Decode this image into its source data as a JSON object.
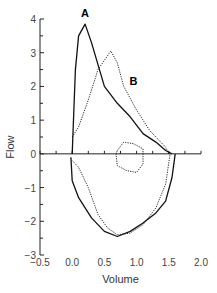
{
  "chart_data": {
    "type": "line",
    "title": "",
    "xlabel": "Volume",
    "ylabel": "Flow",
    "xlim": [
      -0.5,
      2.0
    ],
    "ylim": [
      -3,
      4
    ],
    "x_ticks": [
      "-0.5",
      "0.0",
      "0.5",
      "1.0",
      "1.5",
      "2.0"
    ],
    "y_ticks": [
      "4",
      "3",
      "2",
      "1",
      "0",
      "-1",
      "-2",
      "-3"
    ],
    "grid": false,
    "legend": "none",
    "annotations": [
      {
        "text": "A",
        "x": 0.2,
        "y": 4.05
      },
      {
        "text": "B",
        "x": 0.95,
        "y": 2.05
      }
    ],
    "series": [
      {
        "name": "A",
        "style": "solid",
        "expiratory": [
          [
            0.0,
            0.0
          ],
          [
            0.05,
            2.5
          ],
          [
            0.1,
            3.5
          ],
          [
            0.2,
            3.85
          ],
          [
            0.3,
            3.3
          ],
          [
            0.5,
            2.0
          ],
          [
            0.7,
            1.5
          ],
          [
            0.9,
            1.1
          ],
          [
            1.1,
            0.6
          ],
          [
            1.3,
            0.35
          ],
          [
            1.45,
            0.1
          ],
          [
            1.55,
            0.0
          ]
        ],
        "inspiratory": [
          [
            -0.02,
            -0.1
          ],
          [
            0.0,
            -0.8
          ],
          [
            0.1,
            -1.3
          ],
          [
            0.3,
            -1.9
          ],
          [
            0.5,
            -2.3
          ],
          [
            0.7,
            -2.45
          ],
          [
            0.9,
            -2.3
          ],
          [
            1.1,
            -2.05
          ],
          [
            1.3,
            -1.75
          ],
          [
            1.45,
            -1.4
          ],
          [
            1.55,
            -0.7
          ],
          [
            1.6,
            0.0
          ]
        ]
      },
      {
        "name": "B",
        "style": "dotted",
        "expiratory": [
          [
            0.0,
            0.5
          ],
          [
            0.1,
            0.8
          ],
          [
            0.25,
            1.6
          ],
          [
            0.4,
            2.5
          ],
          [
            0.6,
            3.05
          ],
          [
            0.7,
            2.7
          ],
          [
            0.8,
            2.0
          ],
          [
            1.0,
            1.3
          ],
          [
            1.2,
            0.7
          ],
          [
            1.35,
            0.4
          ],
          [
            1.45,
            0.2
          ],
          [
            1.5,
            0.0
          ]
        ],
        "inspiratory": [
          [
            0.0,
            -0.2
          ],
          [
            0.1,
            -0.4
          ],
          [
            0.25,
            -1.0
          ],
          [
            0.4,
            -1.8
          ],
          [
            0.55,
            -2.2
          ],
          [
            0.7,
            -2.4
          ],
          [
            0.9,
            -2.35
          ],
          [
            1.1,
            -2.1
          ],
          [
            1.3,
            -1.6
          ],
          [
            1.45,
            -0.9
          ],
          [
            1.52,
            0.0
          ]
        ],
        "inner_loop": [
          [
            0.7,
            0.1
          ],
          [
            0.8,
            0.35
          ],
          [
            0.95,
            0.3
          ],
          [
            1.1,
            0.15
          ],
          [
            1.1,
            -0.3
          ],
          [
            1.0,
            -0.55
          ],
          [
            0.85,
            -0.5
          ],
          [
            0.7,
            -0.35
          ],
          [
            0.68,
            0.0
          ],
          [
            0.7,
            0.1
          ]
        ]
      }
    ]
  }
}
